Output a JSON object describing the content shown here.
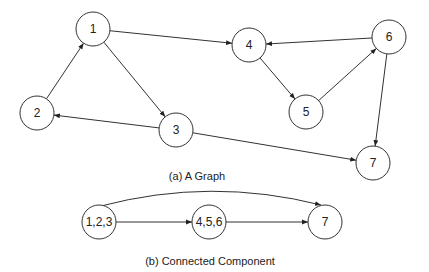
{
  "graph_a": {
    "caption": "(a) A Graph",
    "nodes": [
      {
        "id": "1",
        "label": "1",
        "x": 93,
        "y": 29
      },
      {
        "id": "2",
        "label": "2",
        "x": 37,
        "y": 113
      },
      {
        "id": "3",
        "label": "3",
        "x": 176,
        "y": 130
      },
      {
        "id": "4",
        "label": "4",
        "x": 249,
        "y": 45
      },
      {
        "id": "5",
        "label": "5",
        "x": 306,
        "y": 112
      },
      {
        "id": "6",
        "label": "6",
        "x": 389,
        "y": 37
      },
      {
        "id": "7",
        "label": "7",
        "x": 373,
        "y": 163
      }
    ],
    "edges": [
      {
        "from": "1",
        "to": "4"
      },
      {
        "from": "1",
        "to": "3"
      },
      {
        "from": "2",
        "to": "1"
      },
      {
        "from": "3",
        "to": "2"
      },
      {
        "from": "3",
        "to": "7"
      },
      {
        "from": "4",
        "to": "5"
      },
      {
        "from": "5",
        "to": "6"
      },
      {
        "from": "6",
        "to": "4"
      },
      {
        "from": "6",
        "to": "7"
      }
    ]
  },
  "graph_b": {
    "caption": "(b) Connected Component",
    "nodes": [
      {
        "id": "c123",
        "label": "1,2,3",
        "x": 99,
        "y": 222
      },
      {
        "id": "c456",
        "label": "4,5,6",
        "x": 209,
        "y": 222
      },
      {
        "id": "c7",
        "label": "7",
        "x": 325,
        "y": 222
      }
    ],
    "edges": [
      {
        "from": "c123",
        "to": "c456",
        "curved": false
      },
      {
        "from": "c456",
        "to": "c7",
        "curved": false
      },
      {
        "from": "c123",
        "to": "c7",
        "curved": true
      }
    ]
  },
  "style": {
    "node_radius": 17,
    "stroke": "#333333"
  }
}
